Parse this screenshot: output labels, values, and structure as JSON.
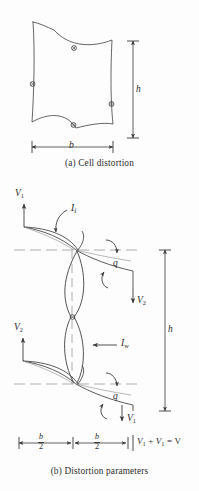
{
  "figure": {
    "panels": [
      {
        "id": "a",
        "caption": "(a)  Cell distortion",
        "dimensions": {
          "height_label": "h",
          "width_label": "b"
        },
        "description": "distorted-quadrilateral-cell-with-midside-nodes"
      },
      {
        "id": "b",
        "caption": "(b)  Distortion parameters",
        "dimensions": {
          "height_label": "h",
          "half_width_num": "b",
          "half_width_den": "2"
        },
        "labels": {
          "v1_top": "V",
          "v1_top_sub": "1",
          "v2_mid_right": "V",
          "v2_mid_right_sub": "2",
          "v2_left": "V",
          "v2_left_sub": "2",
          "v1_bottom": "V",
          "v1_bottom_sub": "1",
          "if": "I",
          "if_sub": "f",
          "iw": "I",
          "iw_sub": "w",
          "q_top": "q",
          "q_bottom": "q",
          "sum_lhs_1": "V",
          "sum_lhs_1_sub": "1",
          "sum_plus": "+",
          "sum_lhs_2": "V",
          "sum_lhs_2_sub": "1",
          "sum_eq": "=",
          "sum_rhs": "V"
        }
      }
    ]
  },
  "colors": {
    "background": "#fdfdfd",
    "stroke": "#3a3a3a",
    "stroke_light": "#9a9a9a",
    "text": "#2b2b2b"
  }
}
